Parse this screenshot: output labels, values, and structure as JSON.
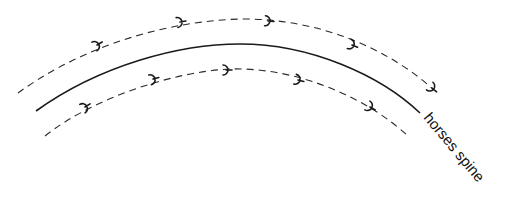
{
  "diagram": {
    "label": "horses spine",
    "colors": {
      "line": "#1a1a1a",
      "background": "#ffffff"
    },
    "elements": {
      "spine": {
        "style": "solid"
      },
      "outer_track": {
        "style": "dashed",
        "hoofprint_count": 5
      },
      "inner_track": {
        "style": "dashed",
        "hoofprint_count": 5
      }
    }
  }
}
